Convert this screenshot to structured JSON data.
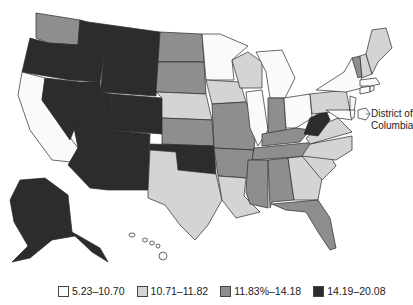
{
  "map": {
    "type": "choropleth",
    "region": "United States",
    "annotation": "District of Columbia",
    "colors": {
      "c1": "#fafafa",
      "c2": "#d4d4d4",
      "c3": "#8e8e8e",
      "c4": "#2c2c2c"
    },
    "legend": [
      {
        "label": "5.23–10.70",
        "class": "c1"
      },
      {
        "label": "10.71–11.82",
        "class": "c2"
      },
      {
        "label": "11.83%–14.18",
        "class": "c3"
      },
      {
        "label": "14.19–20.08",
        "class": "c4"
      }
    ]
  }
}
